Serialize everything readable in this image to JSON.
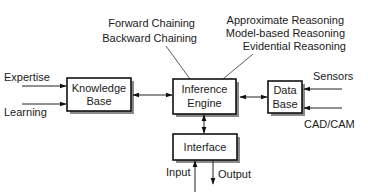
{
  "diagram": {
    "boxes": {
      "knowledge_base": {
        "line1": "Knowledge",
        "line2": "Base"
      },
      "inference_engine": {
        "line1": "Inference",
        "line2": "Engine"
      },
      "data_base": {
        "line1": "Data",
        "line2": "Base"
      },
      "interface": {
        "line1": "Interface"
      }
    },
    "inputs": {
      "expertise": "Expertise",
      "learning": "Learning",
      "sensors": "Sensors",
      "cadcam": "CAD/CAM",
      "input": "Input",
      "output": "Output"
    },
    "annotations": {
      "chaining": [
        "Forward Chaining",
        "Backward Chaining"
      ],
      "reasoning": [
        "Approximate Reasoning",
        "Model-based Reasoning",
        "Evidential Reasoning"
      ]
    },
    "colors": {
      "stroke": "#111111",
      "shadow": "#8a8a8a",
      "text": "#1a1a1a"
    }
  }
}
